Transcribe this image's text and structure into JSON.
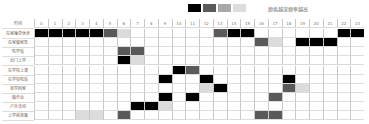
{
  "legend": {
    "swatches": [
      "#000000",
      "#5a5a5a",
      "#a8a8a8",
      "#dcdcdc"
    ],
    "text": "颜色越深频率越高"
  },
  "chart_data": {
    "type": "heatmap",
    "title": "",
    "legend_text": "颜色越深频率越高",
    "xlabel": "时间",
    "categories": [
      "0",
      "1",
      "2",
      "3",
      "4",
      "5",
      "6",
      "7",
      "8",
      "9",
      "10",
      "11",
      "12",
      "13",
      "14",
      "15",
      "16",
      "17",
      "18",
      "19",
      "20",
      "21",
      "22",
      "23"
    ],
    "levels": {
      "0": "none",
      "1": "light",
      "2": "medium",
      "3": "dark",
      "4": "black"
    },
    "rows": [
      {
        "label": "在家睡觉休息",
        "values": [
          4,
          4,
          4,
          4,
          4,
          3,
          1,
          0,
          0,
          0,
          0,
          0,
          0,
          3,
          4,
          4,
          0,
          0,
          0,
          0,
          0,
          0,
          4,
          4
        ]
      },
      {
        "label": "在家做家务",
        "values": [
          0,
          0,
          0,
          0,
          0,
          0,
          0,
          0,
          0,
          0,
          0,
          0,
          0,
          0,
          0,
          0,
          3,
          1,
          0,
          4,
          4,
          4,
          0,
          0
        ]
      },
      {
        "label": "吃早饭",
        "values": [
          0,
          0,
          0,
          0,
          0,
          0,
          3,
          3,
          0,
          0,
          0,
          0,
          0,
          0,
          0,
          0,
          0,
          0,
          0,
          0,
          0,
          0,
          0,
          0
        ]
      },
      {
        "label": "出门上学",
        "values": [
          0,
          0,
          0,
          0,
          0,
          0,
          4,
          1,
          0,
          0,
          0,
          0,
          0,
          0,
          0,
          0,
          0,
          0,
          0,
          0,
          0,
          0,
          0,
          0
        ]
      },
      {
        "label": "在学校上课",
        "values": [
          0,
          0,
          0,
          0,
          0,
          0,
          0,
          0,
          0,
          0,
          4,
          3,
          0,
          0,
          0,
          0,
          0,
          0,
          0,
          0,
          0,
          0,
          0,
          0
        ]
      },
      {
        "label": "在学校吃饭",
        "values": [
          0,
          0,
          0,
          0,
          0,
          0,
          0,
          0,
          0,
          4,
          0,
          0,
          4,
          0,
          0,
          0,
          0,
          0,
          4,
          0,
          0,
          0,
          0,
          0
        ]
      },
      {
        "label": "放学回家",
        "values": [
          0,
          0,
          0,
          0,
          0,
          0,
          0,
          0,
          0,
          0,
          0,
          0,
          1,
          4,
          0,
          0,
          0,
          0,
          3,
          1,
          0,
          0,
          0,
          0
        ]
      },
      {
        "label": "做作业",
        "values": [
          0,
          0,
          0,
          0,
          0,
          0,
          0,
          0,
          0,
          4,
          0,
          4,
          0,
          0,
          0,
          0,
          0,
          3,
          0,
          0,
          0,
          0,
          0,
          0
        ]
      },
      {
        "label": "户外活动",
        "values": [
          0,
          0,
          0,
          0,
          0,
          0,
          0,
          4,
          4,
          1,
          0,
          0,
          0,
          0,
          0,
          0,
          0,
          0,
          0,
          0,
          0,
          0,
          0,
          0
        ]
      },
      {
        "label": "上学前准备",
        "values": [
          0,
          0,
          0,
          1,
          1,
          0,
          3,
          0,
          0,
          0,
          0,
          0,
          0,
          0,
          0,
          0,
          3,
          3,
          0,
          0,
          0,
          0,
          0,
          0
        ]
      }
    ]
  }
}
